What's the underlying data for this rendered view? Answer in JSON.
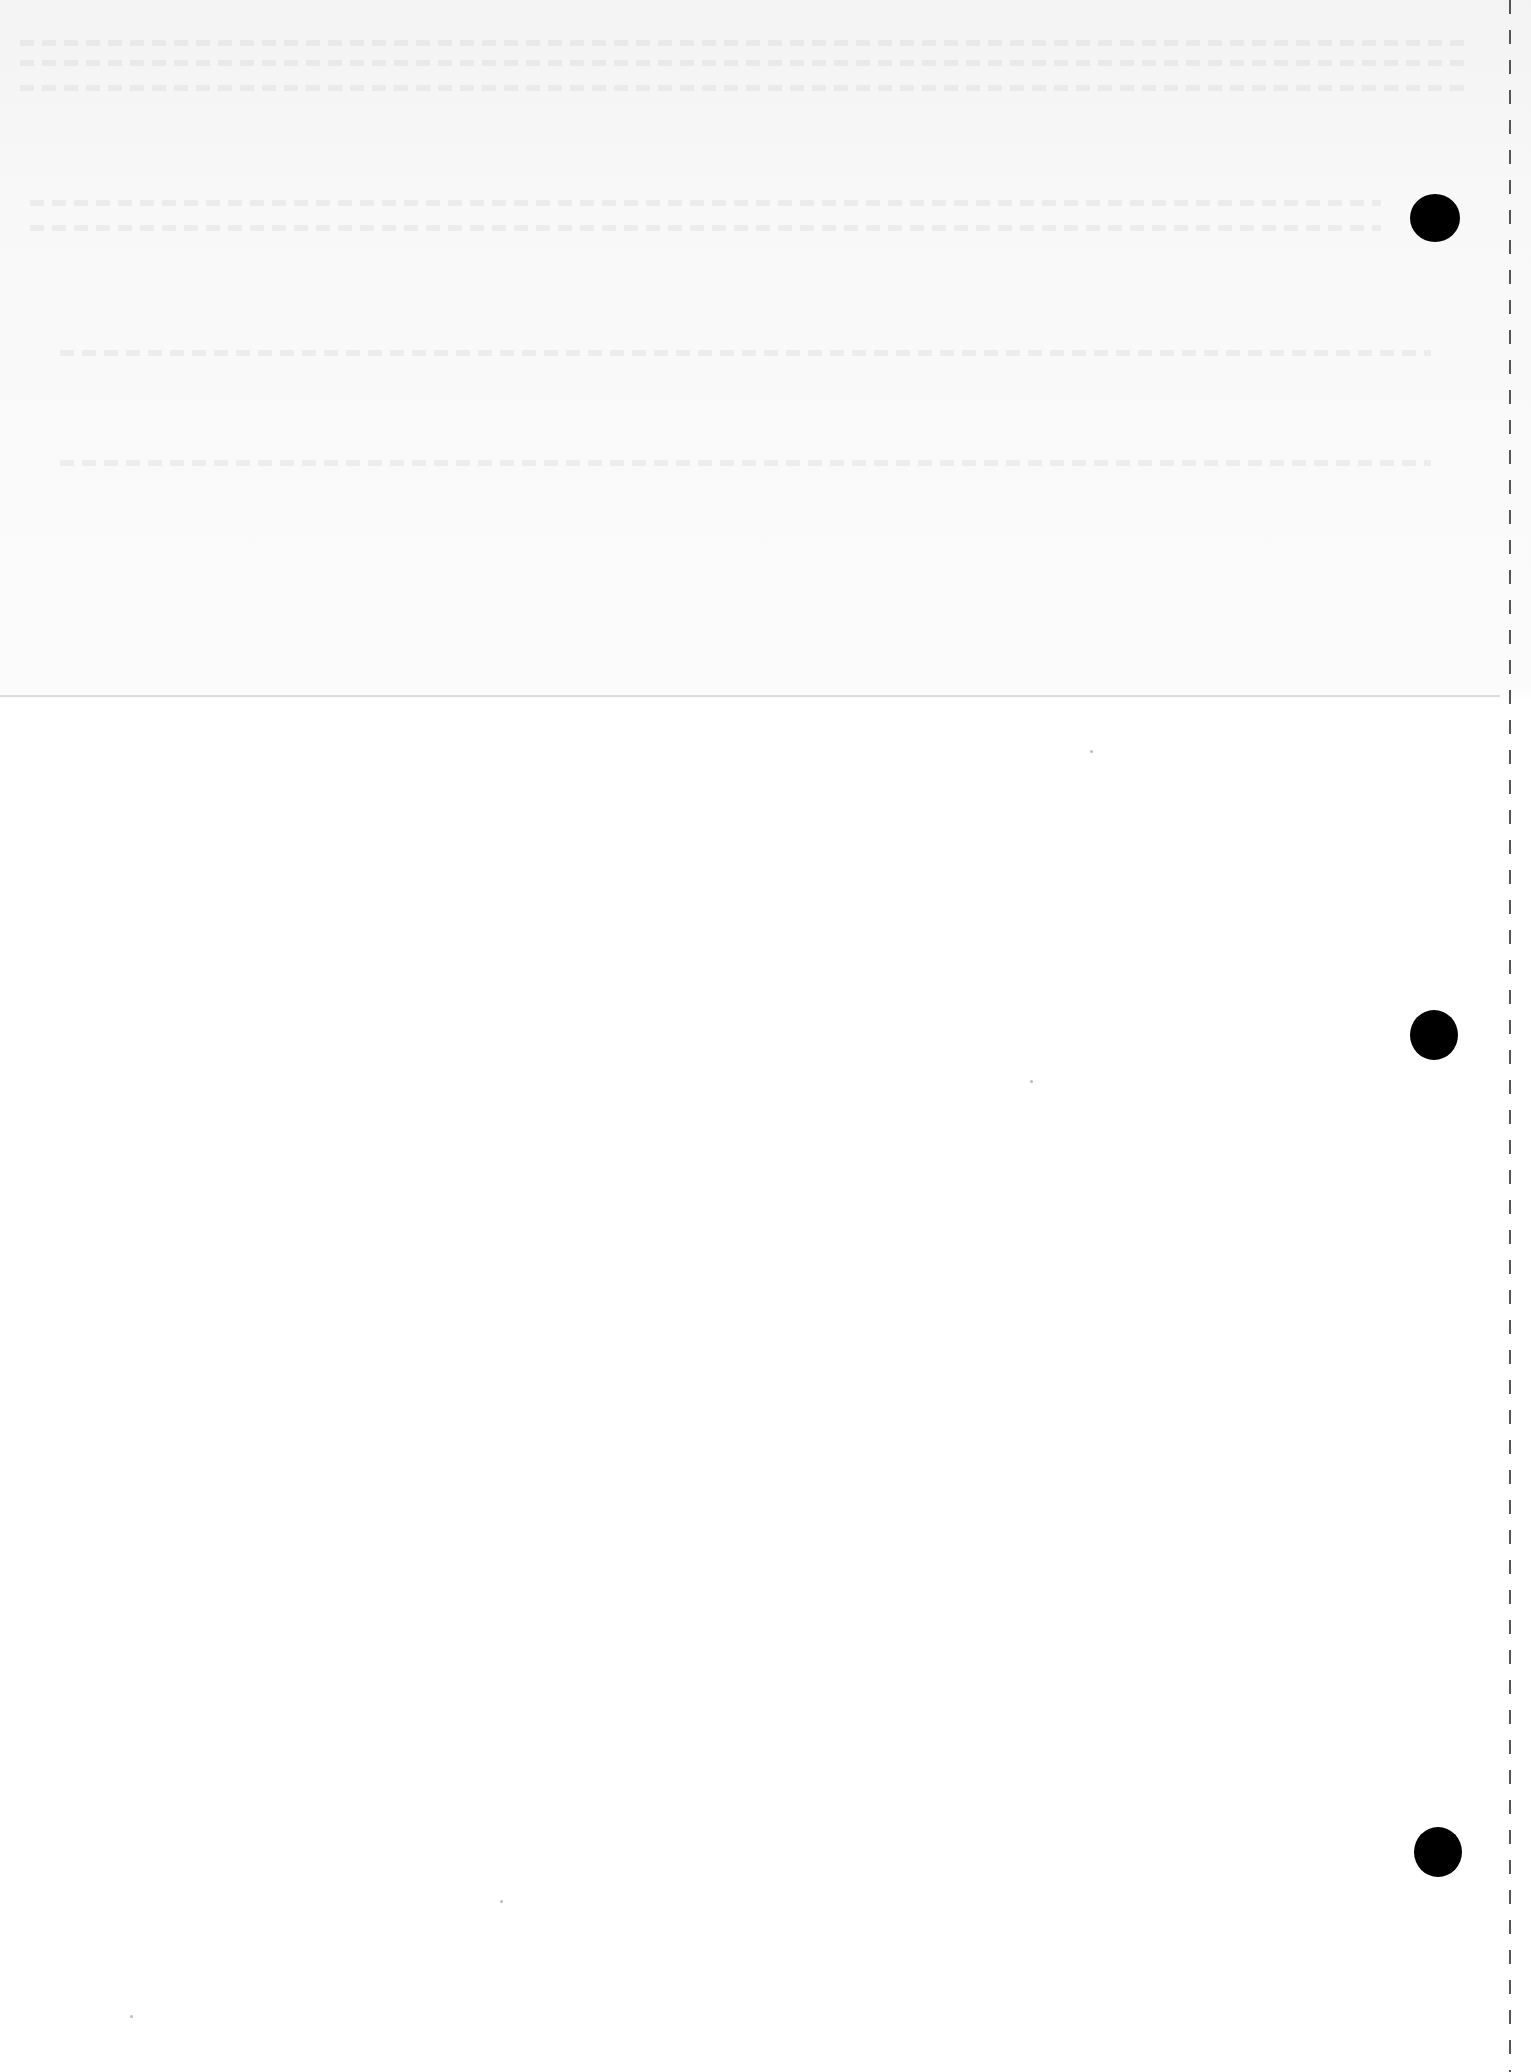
{
  "document": {
    "type": "scanned blank page",
    "text": "",
    "features": {
      "punch_holes": 3,
      "fold_line": true,
      "perforated_edge": "right"
    }
  }
}
